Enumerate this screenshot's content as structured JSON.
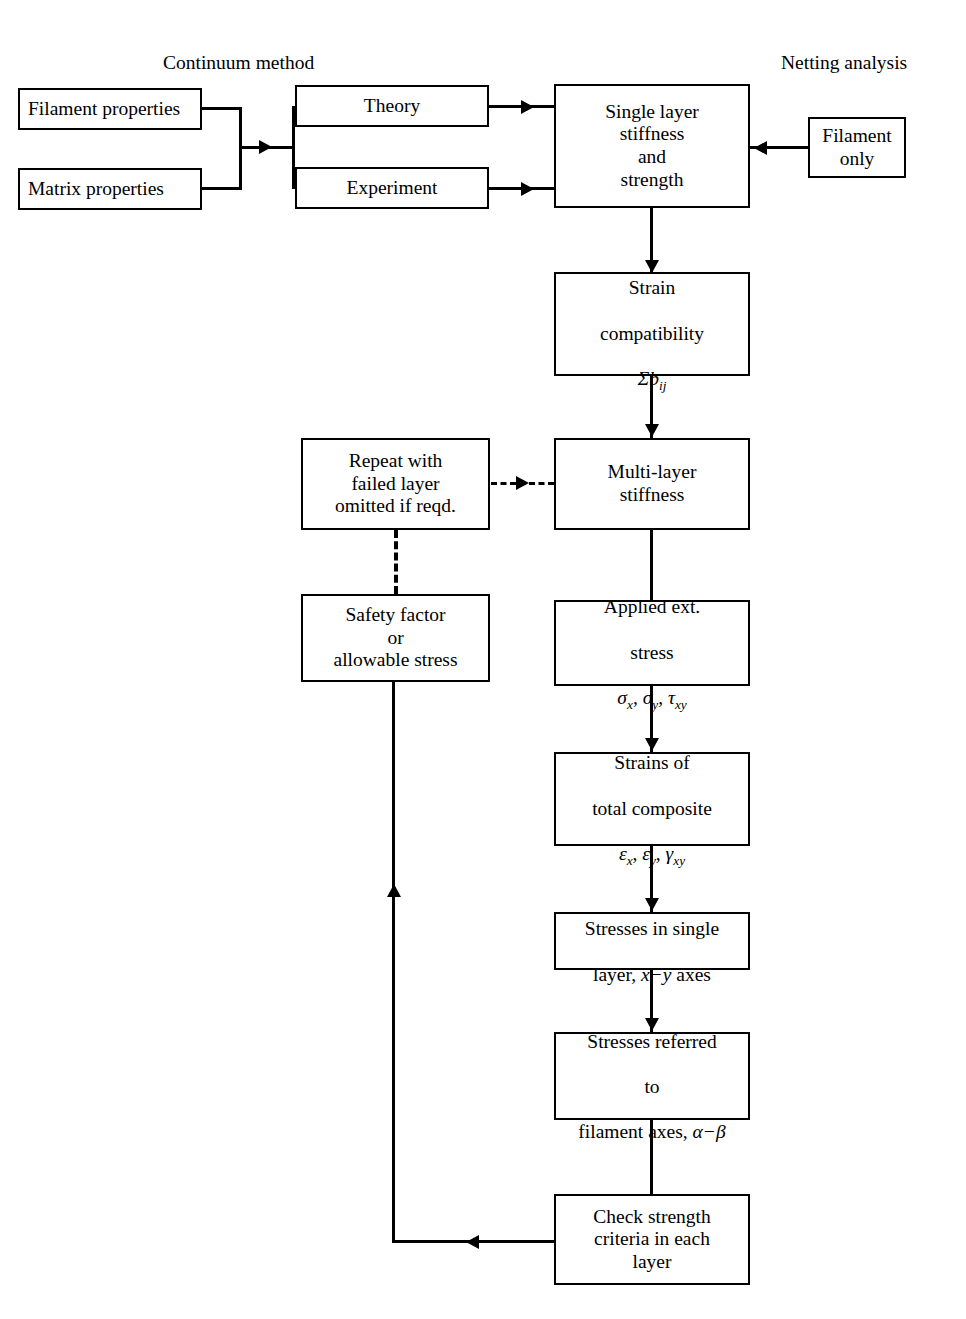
{
  "diagram": {
    "title_left": "Continuum method",
    "title_right": "Netting analysis",
    "nodes": {
      "filament_properties": "Filament properties",
      "matrix_properties": "Matrix properties",
      "theory": "Theory",
      "experiment": "Experiment",
      "single_layer": "Single layer\nstiffness\nand\nstrength",
      "filament_only": "Filament\nonly",
      "strain_compatibility_l1": "Strain",
      "strain_compatibility_l2": "compatibility",
      "strain_compatibility_l3": "Σb",
      "strain_compatibility_sub": "ij",
      "repeat_failed": "Repeat with\nfailed layer\nomitted if reqd.",
      "multi_layer": "Multi-layer\nstiffness",
      "safety_factor": "Safety factor\nor\nallowable stress",
      "applied_stress_l1": "Applied ext.",
      "applied_stress_l2": "stress",
      "applied_stress_sig_x": "σ",
      "applied_stress_sub_x": "x",
      "applied_stress_sig_y": "σ",
      "applied_stress_sub_y": "y",
      "applied_stress_tau": "τ",
      "applied_stress_sub_xy": "xy",
      "strains_l1": "Strains of",
      "strains_l2": "total composite",
      "strains_eps_x": "ε",
      "strains_sub_x": "x",
      "strains_eps_y": "ε",
      "strains_sub_y": "y",
      "strains_gamma": "γ",
      "strains_sub_xy": "xy",
      "stresses_single_l1": "Stresses in single",
      "stresses_single_l2a": "layer, ",
      "stresses_single_axes": "x−y",
      "stresses_single_l2b": " axes",
      "stresses_referred_l1": "Stresses referred",
      "stresses_referred_l2": "to",
      "stresses_referred_l3a": "filament axes, ",
      "stresses_referred_axes": "α−β",
      "check_strength": "Check strength\ncriteria in each\nlayer"
    },
    "colors": {
      "line": "#000000",
      "background": "#ffffff",
      "text": "#000000"
    }
  }
}
